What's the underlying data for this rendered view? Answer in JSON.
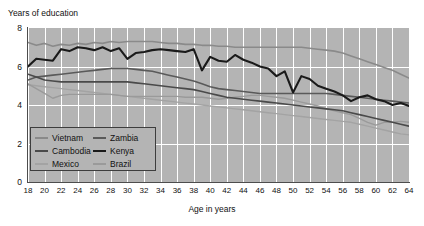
{
  "chart_data": {
    "type": "line",
    "title": "",
    "xlabel": "Age in years",
    "ylabel": "Years of education",
    "xlim": [
      18,
      64
    ],
    "ylim": [
      0,
      8
    ],
    "xticks": [
      "18",
      "20",
      "22",
      "24",
      "26",
      "28",
      "30",
      "32",
      "34",
      "36",
      "38",
      "40",
      "42",
      "44",
      "46",
      "48",
      "50",
      "52",
      "54",
      "56",
      "58",
      "60",
      "62",
      "64"
    ],
    "yticks": [
      "0",
      "2",
      "4",
      "6",
      "8"
    ],
    "grid": "white gridlines on gray panel",
    "legend_position": "lower-left inside plot",
    "x": [
      18,
      19,
      20,
      21,
      22,
      23,
      24,
      25,
      26,
      27,
      28,
      29,
      30,
      31,
      32,
      33,
      34,
      35,
      36,
      37,
      38,
      39,
      40,
      41,
      42,
      43,
      44,
      45,
      46,
      47,
      48,
      49,
      50,
      51,
      52,
      53,
      54,
      55,
      56,
      57,
      58,
      59,
      60,
      61,
      62,
      63,
      64
    ],
    "series": [
      {
        "name": "Vietnam",
        "color": "#8a8a8a",
        "values": [
          7.25,
          7.1,
          7.2,
          7.05,
          7.15,
          7.1,
          7.2,
          7.15,
          7.25,
          7.2,
          7.3,
          7.25,
          7.3,
          7.3,
          7.3,
          7.3,
          7.25,
          7.2,
          7.2,
          7.15,
          7.15,
          7.1,
          7.1,
          7.05,
          7.05,
          7.0,
          7.0,
          7.0,
          7.0,
          7.0,
          7.0,
          7.0,
          7.0,
          7.0,
          6.95,
          6.9,
          6.85,
          6.8,
          6.7,
          6.55,
          6.4,
          6.25,
          6.1,
          5.95,
          5.8,
          5.6,
          5.4
        ]
      },
      {
        "name": "Zambia",
        "color": "#5a5a5a",
        "values": [
          5.3,
          5.45,
          5.5,
          5.55,
          5.6,
          5.65,
          5.7,
          5.75,
          5.8,
          5.85,
          5.9,
          5.9,
          5.9,
          5.85,
          5.8,
          5.75,
          5.65,
          5.55,
          5.45,
          5.35,
          5.25,
          5.1,
          4.95,
          4.85,
          4.8,
          4.75,
          4.7,
          4.65,
          4.6,
          4.6,
          4.6,
          4.6,
          4.6,
          4.6,
          4.6,
          4.6,
          4.6,
          4.55,
          4.5,
          4.45,
          4.4,
          4.35,
          4.3,
          4.25,
          4.2,
          4.15,
          4.1
        ]
      },
      {
        "name": "Cambodia",
        "color": "#4a4a4a",
        "values": [
          5.6,
          5.45,
          5.3,
          5.25,
          5.2,
          5.2,
          5.2,
          5.2,
          5.2,
          5.2,
          5.2,
          5.2,
          5.2,
          5.15,
          5.1,
          5.05,
          5.0,
          4.95,
          4.9,
          4.85,
          4.8,
          4.7,
          4.6,
          4.5,
          4.4,
          4.35,
          4.3,
          4.25,
          4.2,
          4.15,
          4.1,
          4.05,
          4.0,
          3.95,
          3.9,
          3.85,
          3.8,
          3.75,
          3.7,
          3.6,
          3.5,
          3.4,
          3.3,
          3.2,
          3.1,
          3.0,
          2.9
        ]
      },
      {
        "name": "Kenya",
        "color": "#1a1a1a",
        "values": [
          6.0,
          6.4,
          6.35,
          6.3,
          6.9,
          6.8,
          7.0,
          6.95,
          6.85,
          7.0,
          6.8,
          6.95,
          6.4,
          6.7,
          6.75,
          6.85,
          6.9,
          6.85,
          6.8,
          6.75,
          6.9,
          5.8,
          6.5,
          6.3,
          6.25,
          6.6,
          6.35,
          6.2,
          6.0,
          5.9,
          5.5,
          5.75,
          4.65,
          5.5,
          5.35,
          5.0,
          4.85,
          4.7,
          4.5,
          4.2,
          4.4,
          4.5,
          4.3,
          4.2,
          4.0,
          4.1,
          3.95
        ]
      },
      {
        "name": "Mexico",
        "color": "#a3a3a3",
        "values": [
          5.05,
          5.0,
          4.95,
          4.9,
          4.85,
          4.8,
          4.75,
          4.7,
          4.65,
          4.6,
          4.55,
          4.5,
          4.45,
          4.4,
          4.35,
          4.3,
          4.25,
          4.2,
          4.15,
          4.1,
          4.05,
          4.0,
          3.95,
          3.9,
          3.85,
          3.8,
          3.75,
          3.7,
          3.65,
          3.6,
          3.55,
          3.5,
          3.45,
          3.4,
          3.35,
          3.3,
          3.25,
          3.2,
          3.15,
          3.1,
          3.0,
          2.9,
          2.8,
          2.7,
          2.6,
          2.5,
          2.45
        ]
      },
      {
        "name": "Brazil",
        "color": "#9a9a9a",
        "values": [
          5.1,
          4.85,
          4.6,
          4.35,
          4.5,
          4.55,
          4.55,
          4.55,
          4.55,
          4.55,
          4.55,
          4.5,
          4.45,
          4.45,
          4.45,
          4.45,
          4.45,
          4.45,
          4.45,
          4.4,
          4.4,
          4.4,
          4.35,
          4.3,
          4.35,
          4.4,
          4.45,
          4.5,
          4.5,
          4.45,
          4.4,
          4.35,
          4.25,
          4.15,
          4.05,
          3.95,
          3.8,
          3.7,
          3.6,
          3.5,
          3.3,
          3.1,
          2.95,
          3.1,
          3.1,
          3.15,
          3.1
        ]
      }
    ]
  },
  "legend": {
    "items": [
      {
        "label": "Vietnam",
        "color": "#8a8a8a",
        "width": "2px"
      },
      {
        "label": "Zambia",
        "color": "#5a5a5a",
        "width": "2px"
      },
      {
        "label": "Cambodia",
        "color": "#4a4a4a",
        "width": "2px"
      },
      {
        "label": "Kenya",
        "color": "#1a1a1a",
        "width": "2.4px"
      },
      {
        "label": "Mexico",
        "color": "#a3a3a3",
        "width": "2px"
      },
      {
        "label": "Brazil",
        "color": "#9a9a9a",
        "width": "2px"
      }
    ]
  },
  "colors": {
    "panel_background": "#b4b4b4",
    "gridline": "#ffffff",
    "axis": "#4d4d4d",
    "page_background": "#ffffff",
    "text": "#111111"
  }
}
